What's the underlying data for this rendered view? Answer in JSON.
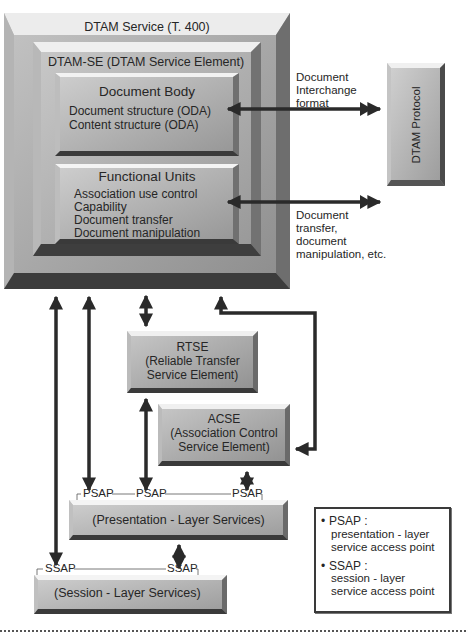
{
  "diagram": {
    "service": {
      "title": "DTAM Service (T. 400)"
    },
    "service_element": {
      "title": "DTAM-SE (DTAM Service Element)"
    },
    "document_body": {
      "title": "Document Body",
      "items": [
        "Document structure (ODA)",
        "Content structure (ODA)"
      ]
    },
    "functional_units": {
      "title": "Functional Units",
      "items": [
        "Association use control",
        "Capability",
        "Document transfer",
        "Document manipulation"
      ]
    },
    "protocol": {
      "title": "DTAM Protocol"
    },
    "labels": {
      "interchange": [
        "Document",
        "Interchange",
        "format"
      ],
      "transfer": [
        "Document",
        "transfer,",
        "document",
        "manipulation, etc."
      ]
    },
    "rtse": {
      "lines": [
        "RTSE",
        "(Reliable Transfer",
        "Service Element)"
      ]
    },
    "acse": {
      "lines": [
        "ACSE",
        "(Association Control",
        "Service Element)"
      ]
    },
    "presentation": {
      "title": "(Presentation - Layer Services)",
      "saps": [
        "PSAP",
        "PSAP",
        "PSAP"
      ]
    },
    "session": {
      "title": "(Session - Layer Services)",
      "saps": [
        "SSAP",
        "SSAP"
      ]
    },
    "legend": {
      "items": [
        {
          "bullet": "•",
          "term": "PSAP :",
          "desc": [
            "presentation - layer",
            "service access point"
          ]
        },
        {
          "bullet": "•",
          "term": "SSAP :",
          "desc": [
            "session - layer",
            "service access point"
          ]
        }
      ]
    },
    "colors": {
      "bevel_dark": "#3a3a3a",
      "bevel_light": "#e6e6e6",
      "face": "#a8a8a8",
      "arrow": "#2a2a2a"
    }
  }
}
